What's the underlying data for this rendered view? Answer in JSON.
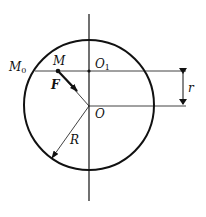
{
  "diagram": {
    "type": "geometry-mechanics",
    "labels": {
      "M0": {
        "main": "M",
        "sub": "0"
      },
      "M": "M",
      "O1": {
        "main": "O",
        "sub": "1"
      },
      "O": "O",
      "F": "F",
      "R": "R",
      "r": "r"
    },
    "colors": {
      "stroke": "#111111",
      "background": "#ffffff"
    }
  }
}
